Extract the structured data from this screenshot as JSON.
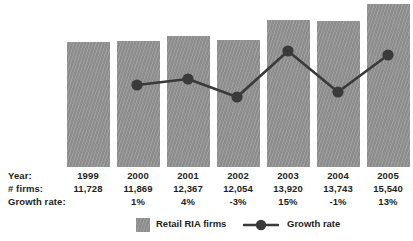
{
  "chart_data": {
    "type": "bar",
    "title": "",
    "subtitle": "",
    "xlabel": "",
    "ylabel": "",
    "grid": false,
    "legend_position": "bottom",
    "categories": [
      "1999",
      "2000",
      "2001",
      "2002",
      "2003",
      "2004",
      "2005"
    ],
    "series": [
      {
        "name": "Retail RIA firms",
        "type": "bar",
        "values": [
          11728,
          11869,
          12367,
          12054,
          13920,
          13743,
          15540
        ],
        "labels": [
          "11,728",
          "11,869",
          "12,367",
          "12,054",
          "13,920",
          "13,743",
          "15,540"
        ],
        "color": "#939393"
      },
      {
        "name": "Growth rate",
        "type": "line",
        "values": [
          null,
          1,
          4,
          -3,
          15,
          -1,
          13
        ],
        "labels": [
          "",
          "1%",
          "4%",
          "-3%",
          "15%",
          "-1%",
          "13%"
        ],
        "color": "#3a3a3a"
      }
    ],
    "ylim": [
      0,
      16000
    ]
  },
  "table": {
    "row_labels": {
      "year": "Year:",
      "firms": "# firms:",
      "growth": "Growth rate:"
    },
    "years": [
      "1999",
      "2000",
      "2001",
      "2002",
      "2003",
      "2004",
      "2005"
    ],
    "firms": [
      "11,728",
      "11,869",
      "12,367",
      "12,054",
      "13,920",
      "13,743",
      "15,540"
    ],
    "growth": [
      "",
      "1%",
      "4%",
      "-3%",
      "15%",
      "-1%",
      "13%"
    ]
  },
  "legend": {
    "bar_label": "Retail RIA firms",
    "line_label": "Growth rate",
    "bar_color": "#939393",
    "line_color": "#3a3a3a"
  },
  "geometry": {
    "bars": [
      {
        "x": 67,
        "y": 42,
        "w": 43,
        "h": 125
      },
      {
        "x": 117,
        "y": 41,
        "w": 43,
        "h": 126
      },
      {
        "x": 167,
        "y": 36,
        "w": 43,
        "h": 131
      },
      {
        "x": 217,
        "y": 40,
        "w": 43,
        "h": 127
      },
      {
        "x": 267,
        "y": 20,
        "w": 43,
        "h": 147
      },
      {
        "x": 317,
        "y": 21,
        "w": 43,
        "h": 146
      },
      {
        "x": 367,
        "y": 4,
        "w": 43,
        "h": 163
      }
    ],
    "points": [
      {
        "cx": 137,
        "cy": 85
      },
      {
        "cx": 188,
        "cy": 79
      },
      {
        "cx": 237,
        "cy": 97
      },
      {
        "cx": 288,
        "cy": 51
      },
      {
        "cx": 338,
        "cy": 92
      },
      {
        "cx": 388,
        "cy": 55
      }
    ],
    "polyline": "137,85 188,79 237,97 288,51 338,92 388,55",
    "column_centers": [
      88,
      138,
      188,
      238,
      288,
      338,
      388
    ],
    "row_y": {
      "year": 2,
      "firms": 15,
      "growth": 28
    }
  }
}
